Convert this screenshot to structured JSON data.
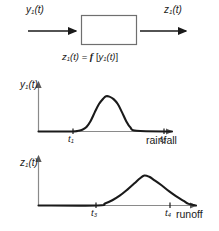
{
  "figure": {
    "background_color": "#ffffff",
    "line_color": "#1a1a1a",
    "axis_color": "#8a8a8a"
  },
  "block_diagram": {
    "input_label_main": "y",
    "input_label_sub": "1",
    "input_label_arg": "(t)",
    "output_label_main": "z",
    "output_label_sub": "1",
    "output_label_arg": "(t)",
    "box_label": "",
    "equation": {
      "lhs_main": "z",
      "lhs_sub": "1",
      "lhs_arg": "(t)",
      "equals": " = ",
      "fn": "f",
      "bracket_open": " [",
      "rhs_main": "y",
      "rhs_sub": "1",
      "rhs_arg": "(t)",
      "bracket_close": "]"
    }
  },
  "chart_data": [
    {
      "type": "line",
      "name": "rainfall-hyetograph",
      "title": "",
      "ylabel_main": "y",
      "ylabel_sub": "1",
      "ylabel_arg": "(t)",
      "xlabel": "rainfall",
      "tick_labels": [
        "t",
        "t"
      ],
      "tick_subs": [
        "1",
        "2"
      ],
      "tick_x_values": [
        1,
        2
      ],
      "xlim": [
        0,
        3.2
      ],
      "ylim": [
        0,
        1.15
      ],
      "grid": false,
      "legend": "none",
      "x": [
        0.0,
        0.8,
        0.95,
        1.05,
        1.15,
        1.25,
        1.35,
        1.45,
        1.55,
        1.62,
        1.7,
        1.8,
        1.9,
        2.0,
        2.1,
        2.2,
        2.35,
        3.2
      ],
      "y": [
        0.0,
        0.0,
        0.02,
        0.05,
        0.13,
        0.3,
        0.55,
        0.78,
        0.93,
        1.0,
        0.99,
        0.92,
        0.78,
        0.55,
        0.3,
        0.12,
        0.02,
        0.0
      ]
    },
    {
      "type": "line",
      "name": "runoff-hydrograph",
      "title": "",
      "ylabel_main": "z",
      "ylabel_sub": "1",
      "ylabel_arg": "(t)",
      "xlabel": "runoff",
      "tick_labels": [
        "t",
        "t"
      ],
      "tick_subs": [
        "3",
        "4"
      ],
      "tick_x_values": [
        3,
        4
      ],
      "xlim": [
        0,
        3.2
      ],
      "ylim": [
        0,
        1.15
      ],
      "grid": false,
      "legend": "none",
      "x": [
        0.0,
        1.2,
        1.35,
        1.5,
        1.65,
        1.8,
        1.95,
        2.05,
        2.15,
        2.25,
        2.35,
        2.5,
        2.65,
        2.8,
        2.95,
        3.05,
        3.2
      ],
      "y": [
        0.0,
        0.0,
        0.06,
        0.16,
        0.3,
        0.48,
        0.68,
        0.82,
        0.92,
        0.88,
        0.78,
        0.62,
        0.44,
        0.28,
        0.14,
        0.05,
        0.0
      ]
    }
  ]
}
